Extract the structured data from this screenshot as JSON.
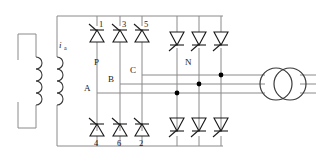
{
  "diagram": {
    "type": "electrical-schematic",
    "colors": {
      "wire": "#808080",
      "device": "#1a1a1a",
      "background": "#ffffff",
      "node": "#000000"
    }
  },
  "labels": {
    "current_ia": "i",
    "current_ia_sub": "a",
    "rail_p": "P",
    "rail_n": "N",
    "phase_a": "A",
    "phase_b": "B",
    "phase_c": "C"
  },
  "thyristors": {
    "left_bridge_top": [
      {
        "id": "1",
        "label": "1",
        "orientation": "up"
      },
      {
        "id": "3",
        "label": "3",
        "orientation": "up"
      },
      {
        "id": "5",
        "label": "5",
        "orientation": "up"
      }
    ],
    "left_bridge_bottom": [
      {
        "id": "4",
        "label": "4",
        "orientation": "up"
      },
      {
        "id": "6",
        "label": "6",
        "orientation": "up"
      },
      {
        "id": "2",
        "label": "2",
        "orientation": "up"
      }
    ],
    "right_bridge_top": [
      {
        "id": "r1",
        "label": "",
        "orientation": "down"
      },
      {
        "id": "r2",
        "label": "",
        "orientation": "down"
      },
      {
        "id": "r3",
        "label": "",
        "orientation": "down"
      }
    ],
    "right_bridge_bottom": [
      {
        "id": "r4",
        "label": "",
        "orientation": "down"
      },
      {
        "id": "r5",
        "label": "",
        "orientation": "down"
      },
      {
        "id": "r6",
        "label": "",
        "orientation": "down"
      }
    ]
  },
  "components": {
    "left_transformer": {
      "name": "source-transformer",
      "primary_turns": 4,
      "secondary_turns": 4
    },
    "right_transformer": {
      "name": "output-transformer",
      "symbol": "two-overlapping-circles",
      "lines_in": 3,
      "lines_out": 3
    }
  },
  "nodes": {
    "junction_dots": 3
  }
}
